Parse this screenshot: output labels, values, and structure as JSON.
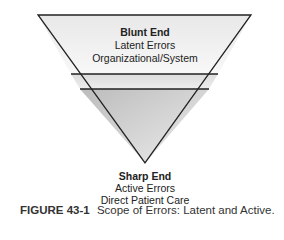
{
  "diagram": {
    "type": "inverted-triangle",
    "top": {
      "title": "Blunt End",
      "line1": "Latent Errors",
      "line2": "Organizational/System"
    },
    "bottom": {
      "title": "Sharp End",
      "line1": "Active Errors",
      "line2": "Direct Patient Care"
    },
    "colors": {
      "top_band": "#f2f2f2",
      "middle_band": "#e4e4e4",
      "bottom_gradient_start": "#c8c8c8",
      "bottom_gradient_end": "#e6e6e6",
      "outline": "#222222"
    }
  },
  "caption": {
    "label": "FIGURE 43-1",
    "text": "Scope of Errors: Latent and Active."
  }
}
